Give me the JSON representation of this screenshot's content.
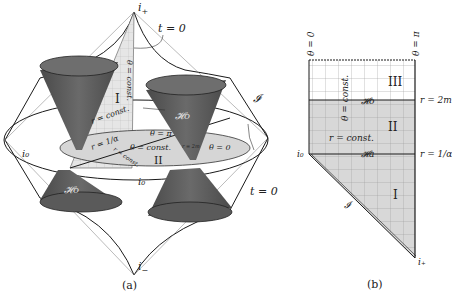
{
  "figure_a": {
    "caption": "(a)",
    "labels": {
      "i_plus": "i",
      "i_plus_sub": "+",
      "i_minus": "i",
      "i_minus_sub": "−",
      "t0_top": "t = 0",
      "t0_right": "t = 0",
      "scri": "𝓘",
      "theta_const_vertical": "θ = const.",
      "r_const": "r = const.",
      "r_1_alpha": "r = 1/α",
      "region_I": "I",
      "region_II": "II",
      "H_o_upper": "𝓗o",
      "H_o_lower": "𝓗o",
      "theta_pi": "θ = π",
      "theta_const": "θ = const.",
      "theta_0": "θ = 0",
      "r_2m": "r = 2m",
      "r_const_disc": "r = const.",
      "i0_left": "i₀",
      "i0_center": "i₀"
    }
  },
  "figure_b": {
    "caption": "(b)",
    "labels": {
      "theta_0": "θ = 0",
      "theta_pi": "θ = π",
      "region_III": "III",
      "region_II": "II",
      "region_I": "I",
      "theta_const": "θ = const.",
      "H_o": "𝓗o",
      "H_a": "𝓗a",
      "r_const": "r = const.",
      "r_2m": "r = 2m",
      "r_1_alpha": "r = 1/α",
      "i0": "i₀",
      "i_plus": "i₊",
      "scri": "𝓘"
    }
  },
  "colors": {
    "cone_fill": "#555555",
    "cone_rim": "#777777",
    "shaded_region": "#d8d8d8",
    "grid_line": "#9a9a9a",
    "line": "#1a1a1a"
  }
}
